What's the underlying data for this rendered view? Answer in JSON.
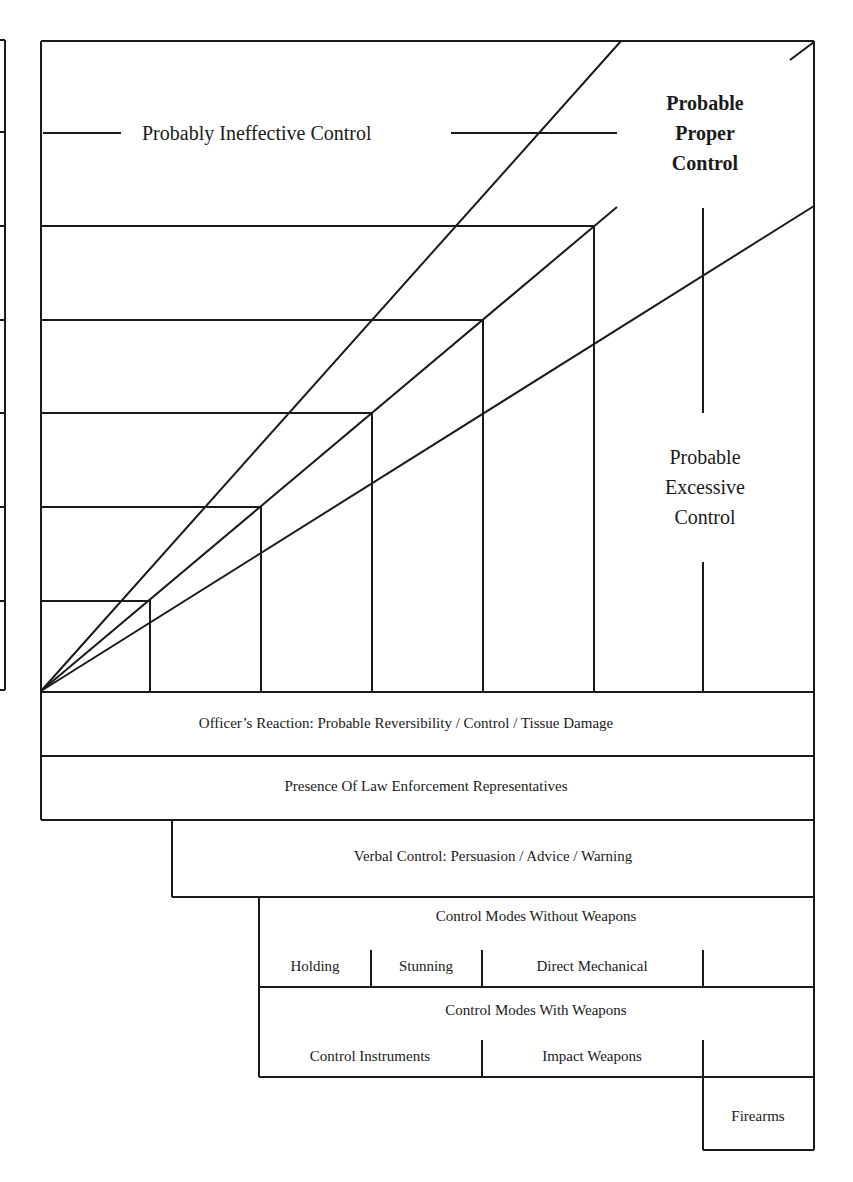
{
  "diagram": {
    "type": "use-of-force continuum",
    "regions": {
      "ineffective": "Probably Ineffective Control",
      "proper": [
        "Probable",
        "Proper",
        "Control"
      ],
      "excessive": [
        "Probable",
        "Excessive",
        "Control"
      ]
    },
    "bands": {
      "officer_reaction": "Officer’s Reaction: Probable Reversibility / Control / Tissue Damage",
      "presence": "Presence Of Law Enforcement Representatives",
      "verbal": "Verbal Control: Persuasion / Advice / Warning",
      "without_weapons": {
        "title": "Control Modes Without Weapons",
        "items": [
          "Holding",
          "Stunning",
          "Direct Mechanical"
        ]
      },
      "with_weapons": {
        "title": "Control Modes With Weapons",
        "items": [
          "Control Instruments",
          "Impact Weapons"
        ]
      },
      "firearms": "Firearms"
    },
    "colors": {
      "line": "#1a1a1a",
      "background": "#ffffff"
    }
  }
}
